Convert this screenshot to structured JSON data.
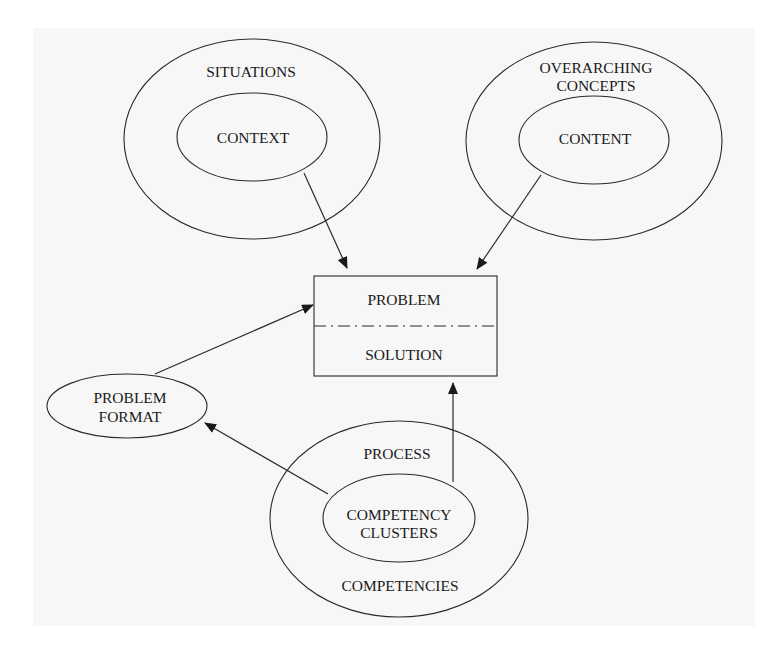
{
  "diagram": {
    "title": "",
    "colors": {
      "stroke": "#2a2a2a",
      "text": "#1a1a1a",
      "background": "#f7f7f7"
    },
    "nodes": {
      "situations": {
        "outer_label": "SITUATIONS",
        "inner_label": "CONTEXT"
      },
      "overarching": {
        "outer_label_line1": "OVERARCHING",
        "outer_label_line2": "CONCEPTS",
        "inner_label": "CONTENT"
      },
      "problem_box": {
        "top_label": "PROBLEM",
        "bottom_label": "SOLUTION"
      },
      "problem_format": {
        "label_line1": "PROBLEM",
        "label_line2": "FORMAT"
      },
      "competencies": {
        "outer_top_label": "PROCESS",
        "inner_label_line1": "COMPETENCY",
        "inner_label_line2": "CLUSTERS",
        "outer_bottom_label": "COMPETENCIES"
      }
    },
    "edges": [
      {
        "from": "CONTEXT",
        "to": "PROBLEM / SOLUTION"
      },
      {
        "from": "CONTENT",
        "to": "PROBLEM / SOLUTION"
      },
      {
        "from": "PROBLEM FORMAT",
        "to": "PROBLEM / SOLUTION"
      },
      {
        "from": "COMPETENCY CLUSTERS",
        "to": "PROBLEM FORMAT"
      },
      {
        "from": "COMPETENCY CLUSTERS",
        "to": "PROBLEM / SOLUTION"
      }
    ]
  }
}
